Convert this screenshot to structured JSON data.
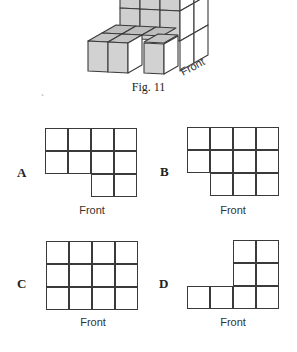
{
  "figure": {
    "caption": "Fig. 11",
    "front_label": "Front",
    "colors": {
      "shaded_face": "#c9c9c9",
      "top_face": "#bdbdbd",
      "white_face": "#ffffff",
      "edge": "#3a3a3a"
    }
  },
  "stray_mark": "`",
  "options": [
    {
      "letter": "A",
      "front_label": "Front",
      "rows": [
        [
          1,
          1,
          1,
          1
        ],
        [
          1,
          1,
          1,
          1
        ],
        [
          0,
          0,
          1,
          1
        ]
      ]
    },
    {
      "letter": "B",
      "front_label": "Front",
      "rows": [
        [
          1,
          1,
          1,
          1
        ],
        [
          1,
          1,
          1,
          1
        ],
        [
          0,
          1,
          1,
          1
        ]
      ]
    },
    {
      "letter": "C",
      "front_label": "Front",
      "rows": [
        [
          1,
          1,
          1,
          1
        ],
        [
          1,
          1,
          1,
          1
        ],
        [
          1,
          1,
          1,
          1
        ]
      ]
    },
    {
      "letter": "D",
      "front_label": "Front",
      "rows": [
        [
          0,
          0,
          1,
          1
        ],
        [
          0,
          0,
          1,
          1
        ],
        [
          1,
          1,
          1,
          1
        ]
      ]
    }
  ]
}
